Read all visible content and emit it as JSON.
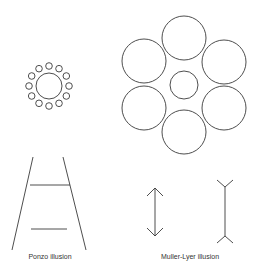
{
  "figures": {
    "ebbinghaus_small": {
      "name": "ebbinghaus-small-surround",
      "center": [
        49,
        86
      ],
      "center_r": 13,
      "ring_r": 20,
      "surround_r": 3.3,
      "surround_count": 12
    },
    "ebbinghaus_large": {
      "name": "ebbinghaus-large-surround",
      "center": [
        184,
        85
      ],
      "center_r": 14,
      "surround_r": 22,
      "surround_centers": [
        [
          184,
          38
        ],
        [
          224,
          62
        ],
        [
          224,
          108
        ],
        [
          184,
          132
        ],
        [
          144,
          108
        ],
        [
          144,
          61
        ]
      ]
    },
    "ponzo": {
      "label": "Ponzo illusion",
      "label_pos": [
        50,
        253
      ],
      "rails": [
        [
          33,
          157,
          12,
          250
        ],
        [
          63,
          157,
          86,
          250
        ]
      ],
      "bars": [
        [
          30,
          185,
          70,
          185
        ],
        [
          31,
          229,
          67,
          229
        ]
      ]
    },
    "muller_lyer": {
      "label": "Muller-Lyer illusion",
      "label_pos": [
        190,
        253
      ]
    }
  },
  "colors": {
    "stroke": "#3a3a3a",
    "background": "#ffffff"
  }
}
